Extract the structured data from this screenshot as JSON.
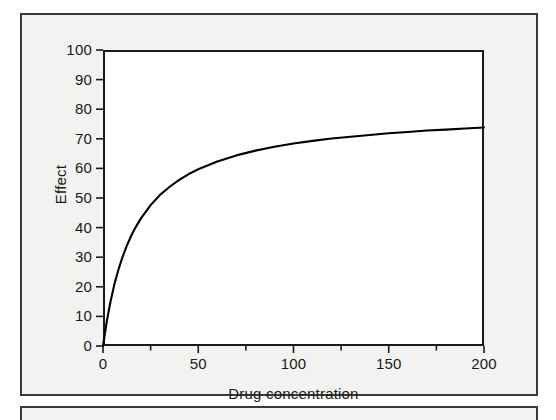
{
  "figure": {
    "panel_background": "#f2f2f0",
    "panel_border_color": "#3a3a3a",
    "plot_background": "#ffffff",
    "plot_border_color": "#1a1a1a",
    "curve_color": "#000000"
  },
  "chart_data": {
    "type": "line",
    "title": "",
    "subtitle": "",
    "xlabel": "Drug concentration",
    "ylabel": "Effect",
    "xlim": [
      0,
      200
    ],
    "ylim": [
      0,
      100
    ],
    "grid": false,
    "legend": null,
    "legend_position": "none",
    "xticks": [
      0,
      50,
      100,
      150,
      200
    ],
    "xtick_labels": [
      "0",
      "50",
      "100",
      "150",
      "200"
    ],
    "xminor_ticks": [
      25,
      75,
      125,
      175
    ],
    "yticks": [
      0,
      10,
      20,
      30,
      40,
      50,
      60,
      70,
      80,
      90,
      100
    ],
    "ytick_labels": [
      "0",
      "10",
      "20",
      "30",
      "40",
      "50",
      "60",
      "70",
      "80",
      "90",
      "100"
    ],
    "model": {
      "name": "Emax hyperbola",
      "equation": "E = Emax * C / (EC50 + C)",
      "Emax": 80,
      "EC50": 17
    },
    "series": [
      {
        "name": "Effect",
        "color": "#000000",
        "line_width": 2,
        "x": [
          0,
          2,
          4,
          6,
          8,
          10,
          12.5,
          15,
          17,
          20,
          25,
          30,
          35,
          40,
          45,
          50,
          60,
          70,
          80,
          90,
          100,
          110,
          120,
          130,
          140,
          150,
          160,
          170,
          180,
          190,
          200
        ],
        "y": [
          0,
          8.4,
          15.2,
          20.9,
          25.6,
          29.6,
          33.9,
          37.5,
          40.0,
          43.2,
          47.6,
          51.1,
          53.8,
          56.1,
          58.1,
          59.7,
          62.3,
          64.4,
          66.0,
          67.3,
          68.4,
          69.3,
          70.1,
          70.7,
          71.3,
          71.9,
          72.3,
          72.8,
          73.1,
          73.5,
          73.8
        ]
      }
    ]
  }
}
